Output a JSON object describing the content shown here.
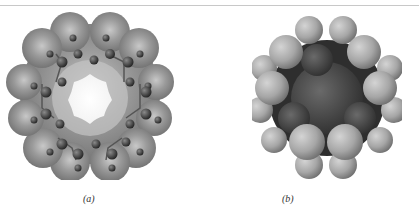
{
  "figure": {
    "panels": [
      {
        "id": "a",
        "label": "(a)",
        "description": "Electrostatic-potential surface of a cyclic molecule with ball-and-stick atoms and a hexagonal central cavity"
      },
      {
        "id": "b",
        "label": "(b)",
        "description": "Space-filling model of the same cyclic molecule"
      }
    ],
    "colors": {
      "surface": "#7a7a7a",
      "surface_light": "#b0b0b0",
      "atom_dark": "#333333",
      "atom_light_sphere": "#a8a8a8",
      "core_dark": "#4a4a4a",
      "rule": "#c8c8c8"
    }
  }
}
